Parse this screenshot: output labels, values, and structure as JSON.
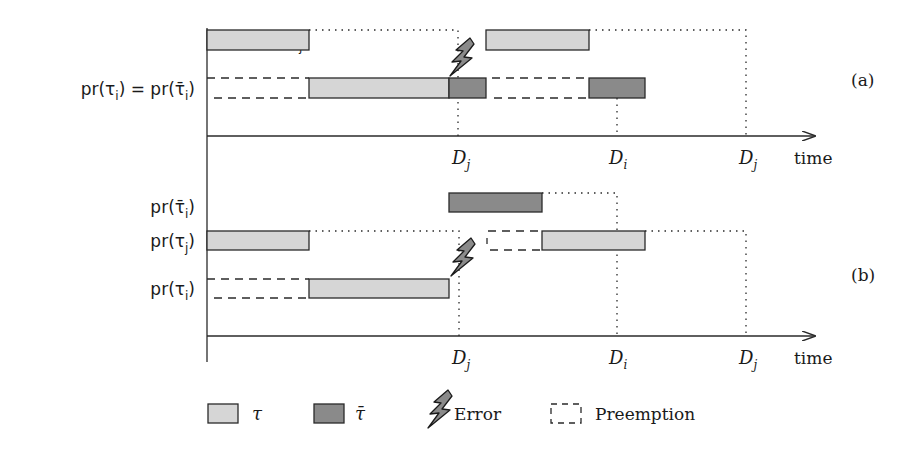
{
  "colors": {
    "tau_fill": "#d6d6d6",
    "tau_bar_fill": "#8a8a8a",
    "stroke": "#2a2a2a",
    "background": "#ffffff"
  },
  "panel_a": {
    "tag": "(a)",
    "rows": [
      {
        "label": "pr(τj)",
        "label_main": "pr(τ",
        "label_sub": "j",
        "label_close": ")"
      },
      {
        "label": "pr(τi) = pr(τ̄i)",
        "label_main": "pr(τ",
        "label_sub": "i",
        "label_mid": ") = pr(τ̄",
        "label_sub2": "i",
        "label_close": ")"
      }
    ],
    "ticks": [
      {
        "name": "D",
        "sub": "j"
      },
      {
        "name": "D",
        "sub": "i"
      },
      {
        "name": "D",
        "sub": "j"
      }
    ],
    "axis_label": "time"
  },
  "panel_b": {
    "tag": "(b)",
    "rows": [
      {
        "label": "pr(τ̄i)",
        "label_main": "pr(τ̄",
        "label_sub": "i",
        "label_close": ")"
      },
      {
        "label": "pr(τj)",
        "label_main": "pr(τ",
        "label_sub": "j",
        "label_close": ")"
      },
      {
        "label": "pr(τi)",
        "label_main": "pr(τ",
        "label_sub": "i",
        "label_close": ")"
      }
    ],
    "ticks": [
      {
        "name": "D",
        "sub": "j"
      },
      {
        "name": "D",
        "sub": "i"
      },
      {
        "name": "D",
        "sub": "j"
      }
    ],
    "axis_label": "time"
  },
  "legend": {
    "items": [
      {
        "symbol": "light-box",
        "label": "τ"
      },
      {
        "symbol": "dark-box",
        "label": "τ̄"
      },
      {
        "symbol": "lightning",
        "label": "Error"
      },
      {
        "symbol": "dashed-box",
        "label": "Preemption"
      }
    ]
  }
}
